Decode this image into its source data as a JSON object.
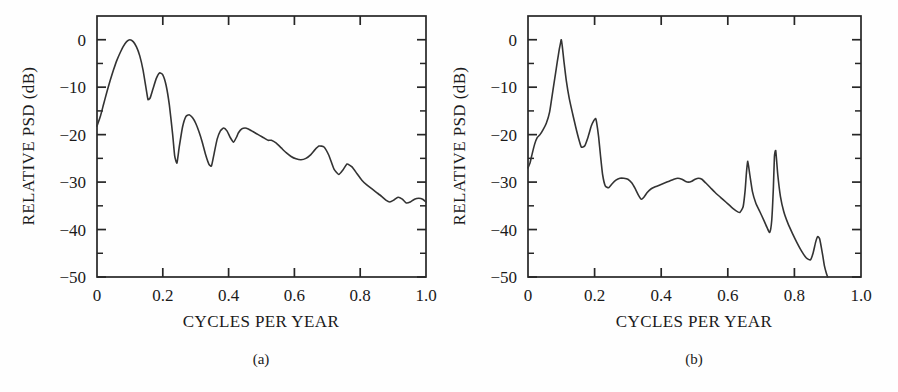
{
  "figure": {
    "background": "#fefefe",
    "line_color": "#333333",
    "axis_color": "#262626"
  },
  "chart_data": [
    {
      "type": "line",
      "panel_label": "(a)",
      "title": "",
      "xlabel": "CYCLES PER YEAR",
      "ylabel": "RELATIVE PSD (dB)",
      "xlim": [
        0.0,
        1.0
      ],
      "ylim": [
        -50,
        5
      ],
      "grid": false,
      "legend": "none",
      "xticks": [
        0.0,
        0.2,
        0.4,
        0.6,
        0.8,
        1.0
      ],
      "xticklabels": [
        "0",
        "0.2",
        "0.4",
        "0.6",
        "0.8",
        "1.0"
      ],
      "yticks": [
        0,
        -10,
        -20,
        -30,
        -40,
        -50
      ],
      "yticklabels": [
        "0",
        "-10",
        "-20",
        "-30",
        "-40",
        "-50"
      ],
      "y_minor_tick_step": 5,
      "x": [
        0.0,
        0.01,
        0.02,
        0.03,
        0.04,
        0.05,
        0.06,
        0.07,
        0.08,
        0.09,
        0.1,
        0.11,
        0.12,
        0.13,
        0.14,
        0.15,
        0.155,
        0.162,
        0.17,
        0.18,
        0.19,
        0.2,
        0.21,
        0.22,
        0.23,
        0.236,
        0.243,
        0.25,
        0.26,
        0.27,
        0.28,
        0.29,
        0.3,
        0.31,
        0.32,
        0.33,
        0.34,
        0.348,
        0.356,
        0.365,
        0.375,
        0.385,
        0.395,
        0.405,
        0.415,
        0.425,
        0.43,
        0.44,
        0.45,
        0.46,
        0.47,
        0.48,
        0.49,
        0.5,
        0.51,
        0.52,
        0.53,
        0.545,
        0.56,
        0.575,
        0.59,
        0.605,
        0.62,
        0.635,
        0.65,
        0.662,
        0.675,
        0.69,
        0.705,
        0.72,
        0.735,
        0.748,
        0.76,
        0.775,
        0.79,
        0.805,
        0.82,
        0.835,
        0.85,
        0.865,
        0.878,
        0.89,
        0.902,
        0.915,
        0.928,
        0.94,
        0.952,
        0.965,
        0.978,
        0.99,
        1.0
      ],
      "y": [
        -18.2,
        -16.2,
        -13.6,
        -11.0,
        -8.6,
        -6.4,
        -4.4,
        -2.8,
        -1.4,
        -0.4,
        0.0,
        -0.4,
        -1.5,
        -3.4,
        -6.4,
        -10.6,
        -12.6,
        -12.2,
        -10.4,
        -8.2,
        -7.0,
        -7.4,
        -9.6,
        -13.8,
        -20.0,
        -24.4,
        -26.0,
        -22.6,
        -18.4,
        -16.2,
        -15.8,
        -16.4,
        -17.6,
        -19.4,
        -21.6,
        -24.2,
        -26.2,
        -26.6,
        -24.0,
        -21.0,
        -19.2,
        -18.6,
        -19.2,
        -20.6,
        -21.6,
        -20.4,
        -19.6,
        -18.8,
        -18.6,
        -18.8,
        -19.2,
        -19.6,
        -20.0,
        -20.4,
        -20.8,
        -21.2,
        -21.2,
        -21.8,
        -22.8,
        -23.8,
        -24.6,
        -25.1,
        -25.3,
        -25.0,
        -24.2,
        -23.2,
        -22.4,
        -22.6,
        -24.4,
        -27.2,
        -28.4,
        -27.4,
        -26.2,
        -26.8,
        -28.2,
        -29.6,
        -30.6,
        -31.4,
        -32.2,
        -33.0,
        -33.8,
        -34.2,
        -33.8,
        -33.2,
        -33.6,
        -34.4,
        -34.2,
        -33.6,
        -33.4,
        -33.6,
        -34.2
      ]
    },
    {
      "type": "line",
      "panel_label": "(b)",
      "title": "",
      "xlabel": "CYCLES PER YEAR",
      "ylabel": "RELATIVE PSD (dB)",
      "xlim": [
        0.0,
        1.0
      ],
      "ylim": [
        -50,
        5
      ],
      "grid": false,
      "legend": "none",
      "xticks": [
        0.0,
        0.2,
        0.4,
        0.6,
        0.8,
        1.0
      ],
      "xticklabels": [
        "0",
        "0.2",
        "0.4",
        "0.6",
        "0.8",
        "1.0"
      ],
      "yticks": [
        0,
        -10,
        -20,
        -30,
        -40,
        -50
      ],
      "yticklabels": [
        "0",
        "-10",
        "-20",
        "-30",
        "-40",
        "-50"
      ],
      "y_minor_tick_step": 5,
      "x": [
        0.0,
        0.006,
        0.012,
        0.02,
        0.028,
        0.036,
        0.045,
        0.055,
        0.065,
        0.075,
        0.082,
        0.088,
        0.094,
        0.098,
        0.1,
        0.103,
        0.108,
        0.115,
        0.124,
        0.134,
        0.144,
        0.152,
        0.16,
        0.17,
        0.18,
        0.19,
        0.198,
        0.203,
        0.206,
        0.212,
        0.218,
        0.224,
        0.232,
        0.242,
        0.252,
        0.264,
        0.276,
        0.288,
        0.3,
        0.312,
        0.322,
        0.332,
        0.34,
        0.348,
        0.358,
        0.37,
        0.382,
        0.396,
        0.41,
        0.424,
        0.438,
        0.45,
        0.462,
        0.472,
        0.482,
        0.492,
        0.502,
        0.512,
        0.522,
        0.534,
        0.548,
        0.562,
        0.578,
        0.594,
        0.61,
        0.624,
        0.636,
        0.646,
        0.652,
        0.656,
        0.66,
        0.666,
        0.674,
        0.684,
        0.696,
        0.708,
        0.718,
        0.726,
        0.732,
        0.737,
        0.74,
        0.744,
        0.75,
        0.758,
        0.768,
        0.78,
        0.794,
        0.808,
        0.822,
        0.836,
        0.848,
        0.856,
        0.864,
        0.87,
        0.876,
        0.884,
        0.89,
        0.896,
        0.9
      ],
      "y": [
        -27.0,
        -26.0,
        -24.2,
        -22.0,
        -20.6,
        -20.0,
        -19.0,
        -17.6,
        -15.2,
        -10.6,
        -7.4,
        -4.6,
        -2.0,
        -0.6,
        0.0,
        -1.4,
        -4.6,
        -8.6,
        -12.4,
        -15.6,
        -18.6,
        -20.8,
        -22.6,
        -22.4,
        -20.6,
        -18.2,
        -17.0,
        -16.6,
        -17.4,
        -20.4,
        -24.6,
        -28.4,
        -30.8,
        -31.2,
        -30.4,
        -29.6,
        -29.2,
        -29.2,
        -29.4,
        -30.2,
        -31.4,
        -32.8,
        -33.6,
        -33.2,
        -32.2,
        -31.4,
        -31.0,
        -30.6,
        -30.2,
        -29.8,
        -29.4,
        -29.2,
        -29.4,
        -29.8,
        -30.0,
        -29.8,
        -29.4,
        -29.2,
        -29.4,
        -30.2,
        -31.2,
        -32.2,
        -33.2,
        -34.2,
        -35.2,
        -36.0,
        -36.4,
        -35.2,
        -31.8,
        -28.0,
        -25.6,
        -28.4,
        -32.0,
        -34.4,
        -36.2,
        -38.0,
        -39.6,
        -40.6,
        -38.0,
        -31.0,
        -24.6,
        -23.4,
        -28.4,
        -33.0,
        -36.2,
        -38.6,
        -40.8,
        -42.8,
        -44.6,
        -46.0,
        -46.4,
        -45.0,
        -42.6,
        -41.5,
        -42.0,
        -45.0,
        -47.6,
        -49.2,
        -50.0
      ]
    }
  ]
}
